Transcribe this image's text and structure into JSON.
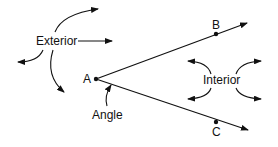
{
  "diagram": {
    "points": {
      "A": {
        "label": "A",
        "x": 95,
        "y": 79
      },
      "B": {
        "label": "B",
        "x": 216,
        "y": 34
      },
      "C": {
        "label": "C",
        "x": 216,
        "y": 122
      }
    },
    "labels": {
      "exterior": "Exterior",
      "interior": "Interior",
      "angle": "Angle"
    },
    "colors": {
      "stroke": "#111111",
      "background": "#ffffff"
    }
  }
}
